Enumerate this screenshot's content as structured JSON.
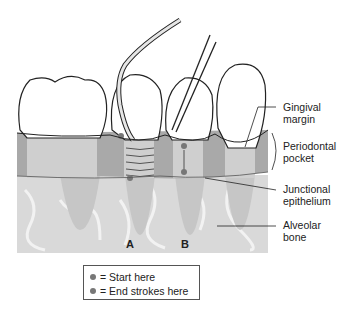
{
  "figure": {
    "type": "dental-anatomy-illustration",
    "labels": {
      "gingival_margin": [
        "Gingival",
        "margin"
      ],
      "periodontal_pocket": [
        "Periodontal",
        "pocket"
      ],
      "junctional_epithelium": [
        "Junctional",
        "epithelium"
      ],
      "alveolar_bone": [
        "Alveolar",
        "bone"
      ]
    },
    "panel_letters": {
      "a": "A",
      "b": "B"
    }
  },
  "legend": {
    "items": [
      {
        "symbol": "dot",
        "text": "= Start here"
      },
      {
        "symbol": "dot",
        "text": "= End strokes here"
      }
    ]
  },
  "colors": {
    "gingiva": "#a8a8a8",
    "bone": "#d6d6d6",
    "bone_light": "#ececec",
    "tooth": "#ffffff",
    "root": "#c8c8c8",
    "outline": "#222222",
    "dot": "#777777"
  }
}
